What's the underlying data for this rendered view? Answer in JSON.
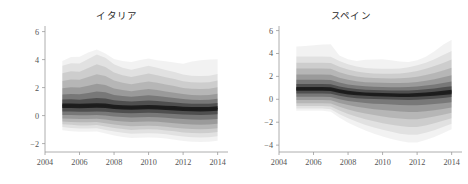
{
  "figure": {
    "background_color": "#ffffff",
    "width": 468,
    "height": 184
  },
  "panels": [
    {
      "id": "italy",
      "title": "イタリア"
    },
    {
      "id": "spain",
      "title": "スペイン"
    }
  ],
  "chart_data": [
    {
      "type": "area",
      "title": "イタリア",
      "xlabel": "",
      "ylabel": "",
      "xlim": [
        2004,
        2014.6
      ],
      "ylim": [
        -2.6,
        6.4
      ],
      "xticks": [
        2004,
        2006,
        2008,
        2010,
        2012,
        2014
      ],
      "yticks": [
        -2,
        0,
        2,
        4,
        6
      ],
      "xtick_labels": [
        "2004",
        "2006",
        "2008",
        "2010",
        "2012",
        "2014"
      ],
      "ytick_labels": [
        "-2",
        "0",
        "2",
        "4",
        "6"
      ],
      "grid": false,
      "legend": "none",
      "style": "fan-chart-density",
      "band_color": "#000000",
      "x": [
        2005.0,
        2005.5,
        2006.0,
        2006.5,
        2007.0,
        2007.5,
        2008.0,
        2008.5,
        2009.0,
        2009.5,
        2010.0,
        2010.5,
        2011.0,
        2011.5,
        2012.0,
        2012.5,
        2013.0,
        2013.5,
        2014.0
      ],
      "median": [
        0.7,
        0.7,
        0.68,
        0.7,
        0.72,
        0.7,
        0.62,
        0.58,
        0.56,
        0.58,
        0.6,
        0.58,
        0.55,
        0.52,
        0.48,
        0.46,
        0.45,
        0.46,
        0.5
      ],
      "bands": [
        {
          "level": 0.1,
          "opacity": 0.62,
          "lower": [
            0.55,
            0.55,
            0.53,
            0.54,
            0.56,
            0.54,
            0.47,
            0.43,
            0.41,
            0.43,
            0.45,
            0.43,
            0.4,
            0.37,
            0.33,
            0.31,
            0.3,
            0.31,
            0.35
          ],
          "upper": [
            0.86,
            0.86,
            0.84,
            0.87,
            0.89,
            0.87,
            0.78,
            0.74,
            0.72,
            0.74,
            0.76,
            0.74,
            0.71,
            0.68,
            0.64,
            0.62,
            0.61,
            0.62,
            0.66
          ]
        },
        {
          "level": 0.25,
          "opacity": 0.34,
          "lower": [
            0.3,
            0.3,
            0.28,
            0.28,
            0.3,
            0.28,
            0.22,
            0.18,
            0.16,
            0.18,
            0.2,
            0.18,
            0.15,
            0.12,
            0.08,
            0.06,
            0.05,
            0.06,
            0.1
          ],
          "upper": [
            1.15,
            1.16,
            1.14,
            1.2,
            1.26,
            1.22,
            1.1,
            1.04,
            1.0,
            1.04,
            1.08,
            1.04,
            0.99,
            0.94,
            0.88,
            0.85,
            0.84,
            0.85,
            0.9
          ]
        },
        {
          "level": 0.4,
          "opacity": 0.22,
          "lower": [
            0.05,
            0.04,
            0.02,
            0.02,
            0.04,
            0.0,
            -0.06,
            -0.1,
            -0.14,
            -0.12,
            -0.1,
            -0.12,
            -0.16,
            -0.2,
            -0.25,
            -0.28,
            -0.3,
            -0.28,
            -0.24
          ],
          "upper": [
            1.5,
            1.54,
            1.52,
            1.62,
            1.72,
            1.66,
            1.48,
            1.4,
            1.34,
            1.4,
            1.46,
            1.4,
            1.32,
            1.26,
            1.18,
            1.14,
            1.12,
            1.14,
            1.2
          ]
        },
        {
          "level": 0.55,
          "opacity": 0.15,
          "lower": [
            -0.2,
            -0.22,
            -0.24,
            -0.24,
            -0.22,
            -0.28,
            -0.36,
            -0.42,
            -0.46,
            -0.44,
            -0.42,
            -0.44,
            -0.5,
            -0.55,
            -0.6,
            -0.64,
            -0.66,
            -0.64,
            -0.58
          ],
          "upper": [
            1.95,
            2.02,
            2.0,
            2.14,
            2.28,
            2.18,
            1.94,
            1.82,
            1.74,
            1.82,
            1.9,
            1.82,
            1.72,
            1.64,
            1.54,
            1.48,
            1.46,
            1.48,
            1.56
          ]
        },
        {
          "level": 0.7,
          "opacity": 0.11,
          "lower": [
            -0.42,
            -0.46,
            -0.48,
            -0.48,
            -0.46,
            -0.54,
            -0.64,
            -0.7,
            -0.76,
            -0.74,
            -0.72,
            -0.74,
            -0.8,
            -0.86,
            -0.92,
            -0.96,
            -0.98,
            -0.96,
            -0.9
          ],
          "upper": [
            2.48,
            2.58,
            2.56,
            2.76,
            2.96,
            2.82,
            2.5,
            2.34,
            2.24,
            2.34,
            2.44,
            2.34,
            2.22,
            2.12,
            1.98,
            1.92,
            1.9,
            1.92,
            2.02
          ]
        },
        {
          "level": 0.82,
          "opacity": 0.085,
          "lower": [
            -0.62,
            -0.66,
            -0.7,
            -0.7,
            -0.68,
            -0.78,
            -0.88,
            -0.96,
            -1.02,
            -1.0,
            -0.98,
            -1.0,
            -1.06,
            -1.12,
            -1.2,
            -1.24,
            -1.26,
            -1.24,
            -1.18
          ],
          "upper": [
            3.02,
            3.16,
            3.14,
            3.4,
            3.66,
            3.48,
            3.08,
            2.88,
            2.76,
            2.88,
            3.0,
            2.88,
            2.74,
            2.62,
            2.46,
            2.38,
            2.36,
            2.38,
            2.5
          ]
        },
        {
          "level": 0.92,
          "opacity": 0.065,
          "lower": [
            -0.82,
            -0.88,
            -0.92,
            -0.92,
            -0.9,
            -1.02,
            -1.14,
            -1.22,
            -1.3,
            -1.28,
            -1.26,
            -1.28,
            -1.34,
            -1.42,
            -1.5,
            -1.54,
            -1.56,
            -1.54,
            -1.48
          ],
          "upper": [
            3.56,
            3.74,
            3.72,
            4.04,
            4.36,
            4.14,
            3.66,
            3.42,
            3.28,
            3.42,
            3.56,
            3.42,
            3.26,
            3.12,
            2.94,
            2.84,
            2.82,
            2.84,
            2.98
          ]
        },
        {
          "level": 0.98,
          "opacity": 0.05,
          "lower": [
            -1.04,
            -1.12,
            -1.16,
            -1.16,
            -1.14,
            -1.28,
            -1.42,
            -1.52,
            -1.6,
            -1.58,
            -1.56,
            -1.58,
            -1.64,
            -1.72,
            -1.82,
            -1.86,
            -1.88,
            -1.86,
            -1.8
          ],
          "upper": [
            3.9,
            4.18,
            4.2,
            4.5,
            4.72,
            4.44,
            4.04,
            3.9,
            3.82,
            3.98,
            4.08,
            3.96,
            3.88,
            3.8,
            3.7,
            3.86,
            3.96,
            4.0,
            4.02
          ]
        }
      ]
    },
    {
      "type": "area",
      "title": "スペイン",
      "xlabel": "",
      "ylabel": "",
      "xlim": [
        2004,
        2014.6
      ],
      "ylim": [
        -4.6,
        6.4
      ],
      "xticks": [
        2004,
        2006,
        2008,
        2010,
        2012,
        2014
      ],
      "yticks": [
        -4,
        -2,
        0,
        2,
        4,
        6
      ],
      "xtick_labels": [
        "2004",
        "2006",
        "2008",
        "2010",
        "2012",
        "2014"
      ],
      "ytick_labels": [
        "-4",
        "-2",
        "0",
        "2",
        "4",
        "6"
      ],
      "grid": false,
      "legend": "none",
      "style": "fan-chart-density",
      "band_color": "#000000",
      "x": [
        2005.0,
        2005.5,
        2006.0,
        2006.5,
        2007.0,
        2007.5,
        2008.0,
        2008.5,
        2009.0,
        2009.5,
        2010.0,
        2010.5,
        2011.0,
        2011.5,
        2012.0,
        2012.5,
        2013.0,
        2013.5,
        2014.0
      ],
      "median": [
        0.9,
        0.9,
        0.9,
        0.9,
        0.88,
        0.7,
        0.58,
        0.5,
        0.45,
        0.42,
        0.4,
        0.38,
        0.36,
        0.36,
        0.38,
        0.42,
        0.48,
        0.56,
        0.64
      ],
      "bands": [
        {
          "level": 0.1,
          "opacity": 0.62,
          "lower": [
            0.74,
            0.74,
            0.74,
            0.74,
            0.72,
            0.54,
            0.43,
            0.35,
            0.3,
            0.27,
            0.25,
            0.23,
            0.21,
            0.21,
            0.22,
            0.26,
            0.31,
            0.38,
            0.45
          ],
          "upper": [
            1.07,
            1.07,
            1.07,
            1.07,
            1.05,
            0.87,
            0.74,
            0.66,
            0.6,
            0.57,
            0.55,
            0.53,
            0.51,
            0.51,
            0.54,
            0.59,
            0.66,
            0.75,
            0.84
          ]
        },
        {
          "level": 0.25,
          "opacity": 0.34,
          "lower": [
            0.5,
            0.5,
            0.5,
            0.5,
            0.48,
            0.3,
            0.18,
            0.1,
            0.05,
            0.02,
            0.0,
            -0.02,
            -0.04,
            -0.05,
            -0.04,
            0.0,
            0.05,
            0.12,
            0.2
          ],
          "upper": [
            1.34,
            1.34,
            1.34,
            1.34,
            1.32,
            1.12,
            0.98,
            0.9,
            0.84,
            0.81,
            0.79,
            0.77,
            0.76,
            0.77,
            0.81,
            0.87,
            0.95,
            1.05,
            1.15
          ]
        },
        {
          "level": 0.4,
          "opacity": 0.22,
          "lower": [
            0.22,
            0.22,
            0.22,
            0.22,
            0.2,
            0.0,
            -0.14,
            -0.24,
            -0.32,
            -0.38,
            -0.42,
            -0.46,
            -0.5,
            -0.52,
            -0.52,
            -0.48,
            -0.42,
            -0.34,
            -0.26
          ],
          "upper": [
            1.7,
            1.7,
            1.7,
            1.7,
            1.68,
            1.46,
            1.3,
            1.2,
            1.14,
            1.1,
            1.08,
            1.06,
            1.05,
            1.07,
            1.12,
            1.2,
            1.3,
            1.42,
            1.56
          ]
        },
        {
          "level": 0.55,
          "opacity": 0.15,
          "lower": [
            -0.06,
            -0.06,
            -0.06,
            -0.06,
            -0.08,
            -0.32,
            -0.5,
            -0.64,
            -0.76,
            -0.86,
            -0.94,
            -1.0,
            -1.06,
            -1.1,
            -1.1,
            -1.04,
            -0.96,
            -0.84,
            -0.72
          ],
          "upper": [
            2.16,
            2.16,
            2.16,
            2.16,
            2.14,
            1.88,
            1.7,
            1.58,
            1.5,
            1.46,
            1.44,
            1.42,
            1.42,
            1.45,
            1.52,
            1.62,
            1.76,
            1.92,
            2.1
          ]
        },
        {
          "level": 0.7,
          "opacity": 0.11,
          "lower": [
            -0.34,
            -0.34,
            -0.34,
            -0.34,
            -0.36,
            -0.66,
            -0.9,
            -1.08,
            -1.24,
            -1.38,
            -1.5,
            -1.6,
            -1.68,
            -1.74,
            -1.74,
            -1.64,
            -1.5,
            -1.34,
            -1.18
          ],
          "upper": [
            2.68,
            2.68,
            2.68,
            2.68,
            2.66,
            2.36,
            2.14,
            2.0,
            1.9,
            1.86,
            1.84,
            1.82,
            1.83,
            1.88,
            1.98,
            2.12,
            2.3,
            2.52,
            2.76
          ]
        },
        {
          "level": 0.82,
          "opacity": 0.085,
          "lower": [
            -0.58,
            -0.58,
            -0.58,
            -0.58,
            -0.62,
            -0.98,
            -1.28,
            -1.52,
            -1.74,
            -1.92,
            -2.08,
            -2.22,
            -2.34,
            -2.42,
            -2.42,
            -2.28,
            -2.1,
            -1.88,
            -1.66
          ],
          "upper": [
            3.2,
            3.2,
            3.2,
            3.2,
            3.18,
            2.84,
            2.6,
            2.42,
            2.32,
            2.26,
            2.24,
            2.24,
            2.26,
            2.34,
            2.48,
            2.66,
            2.9,
            3.18,
            3.48
          ]
        },
        {
          "level": 0.92,
          "opacity": 0.065,
          "lower": [
            -0.8,
            -0.8,
            -0.8,
            -0.8,
            -0.86,
            -1.3,
            -1.66,
            -1.96,
            -2.24,
            -2.46,
            -2.66,
            -2.84,
            -3.0,
            -3.1,
            -3.1,
            -2.92,
            -2.7,
            -2.42,
            -2.14
          ],
          "upper": [
            3.74,
            3.74,
            3.74,
            3.74,
            3.72,
            3.34,
            3.06,
            2.86,
            2.74,
            2.68,
            2.66,
            2.66,
            2.7,
            2.8,
            2.98,
            3.2,
            3.5,
            3.86,
            4.22
          ]
        },
        {
          "level": 0.98,
          "opacity": 0.05,
          "lower": [
            -1.0,
            -1.0,
            -1.0,
            -1.0,
            -1.08,
            -1.62,
            -2.04,
            -2.4,
            -2.72,
            -3.0,
            -3.24,
            -3.46,
            -3.64,
            -3.76,
            -3.76,
            -3.56,
            -3.28,
            -2.96,
            -2.62
          ],
          "upper": [
            4.6,
            4.66,
            4.72,
            4.78,
            4.8,
            3.82,
            3.5,
            3.34,
            3.46,
            3.48,
            3.5,
            3.4,
            3.3,
            3.26,
            3.4,
            3.72,
            4.2,
            4.76,
            5.2
          ]
        }
      ]
    }
  ]
}
